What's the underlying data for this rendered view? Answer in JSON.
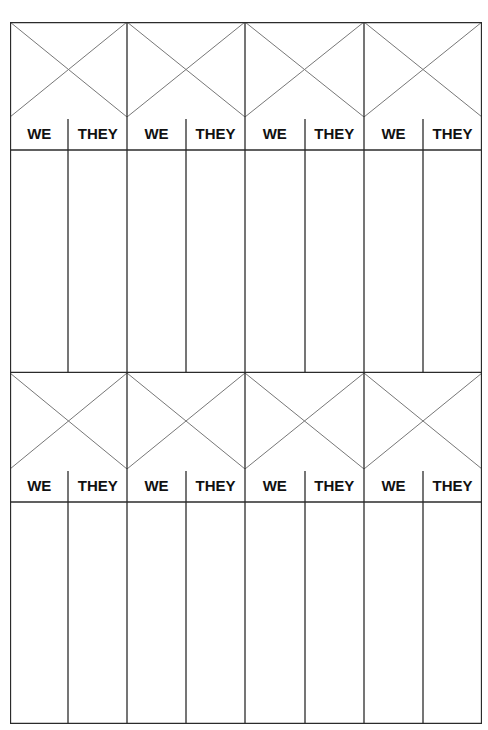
{
  "document": {
    "type": "scoresheet",
    "blocks": [
      {
        "games": [
          {
            "we_label": "WE",
            "they_label": "THEY"
          },
          {
            "we_label": "WE",
            "they_label": "THEY"
          },
          {
            "we_label": "WE",
            "they_label": "THEY"
          },
          {
            "we_label": "WE",
            "they_label": "THEY"
          }
        ]
      },
      {
        "games": [
          {
            "we_label": "WE",
            "they_label": "THEY"
          },
          {
            "we_label": "WE",
            "they_label": "THEY"
          },
          {
            "we_label": "WE",
            "they_label": "THEY"
          },
          {
            "we_label": "WE",
            "they_label": "THEY"
          }
        ]
      }
    ],
    "colors": {
      "line": "#2b2b2b",
      "diagonal": "#777777",
      "text": "#111111",
      "background": "#ffffff"
    }
  }
}
